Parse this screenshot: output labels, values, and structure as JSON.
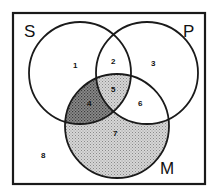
{
  "diagram": {
    "type": "venn-3-set",
    "sets": [
      {
        "id": "S",
        "label": "S"
      },
      {
        "id": "P",
        "label": "P"
      },
      {
        "id": "M",
        "label": "M"
      }
    ],
    "regions": [
      {
        "number": "1",
        "sets": [
          "S"
        ],
        "shading": "none"
      },
      {
        "number": "2",
        "sets": [
          "S",
          "P"
        ],
        "shading": "none"
      },
      {
        "number": "3",
        "sets": [
          "P"
        ],
        "shading": "none"
      },
      {
        "number": "4",
        "sets": [
          "S",
          "M"
        ],
        "shading": "dark"
      },
      {
        "number": "5",
        "sets": [
          "S",
          "P",
          "M"
        ],
        "shading": "light"
      },
      {
        "number": "6",
        "sets": [
          "P",
          "M"
        ],
        "shading": "none"
      },
      {
        "number": "7",
        "sets": [
          "M"
        ],
        "shading": "light"
      },
      {
        "number": "8",
        "sets": [],
        "shading": "none"
      }
    ],
    "colors": {
      "stroke": "#1a1a1a",
      "light_shade": "#bdbdbd",
      "dark_shade": "#6e6e6e",
      "background": "#ffffff"
    }
  }
}
